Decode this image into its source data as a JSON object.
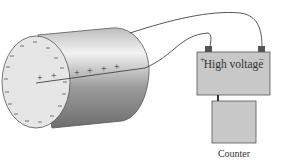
{
  "diagram": {
    "components": {
      "tube": {
        "inner_charges": [
          "+",
          "+",
          "+",
          "+",
          "+",
          "+"
        ],
        "wall_charges": "-"
      },
      "power_supply": {
        "label": "High voltage",
        "terminal_positive": "+",
        "terminal_negative": "–"
      },
      "counter": {
        "label": "Counter"
      }
    },
    "colors": {
      "box_fill": "#c8c8c8",
      "box_stroke": "#555555",
      "tube_face": "#e6e6e6",
      "wire": "#444444"
    }
  }
}
